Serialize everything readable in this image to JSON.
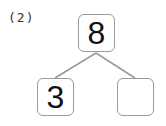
{
  "problem_label": "(2)",
  "tree": {
    "top": {
      "value": "8"
    },
    "bottom_left": {
      "value": "3"
    },
    "bottom_right": {
      "value": ""
    }
  },
  "colors": {
    "border": "#9a9a9a",
    "line": "#9a9a9a",
    "text": "#111111"
  }
}
